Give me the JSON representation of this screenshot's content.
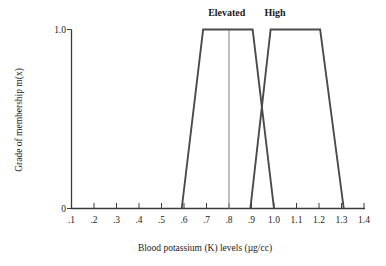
{
  "chart_data": {
    "type": "line",
    "title": "",
    "xlabel": "Blood potassium (K) levels (µg/cc)",
    "ylabel": "Grade of membership m(x)",
    "xlim": [
      0.1,
      1.4
    ],
    "ylim": [
      0,
      1.0
    ],
    "grid": false,
    "legend_position": "above-curves",
    "xticks": [
      ".1",
      ".2",
      ".3",
      ".4",
      ".5",
      ".6",
      ".7",
      ".8",
      ".9",
      "1.0",
      "1.1",
      "1.2",
      "1.3",
      "1.4"
    ],
    "xtick_values": [
      0.1,
      0.2,
      0.3,
      0.4,
      0.5,
      0.6,
      0.7,
      0.8,
      0.9,
      1.0,
      1.1,
      1.2,
      1.3,
      1.4
    ],
    "yticks": [
      "0",
      "1.0"
    ],
    "ytick_values": [
      0,
      1.0
    ],
    "annotations": [
      {
        "text": "Elevated",
        "x": 0.79,
        "y": 1.08
      },
      {
        "text": "High",
        "x": 1.005,
        "y": 1.08
      }
    ],
    "guides": [
      {
        "label": "vertical-guide-0.8",
        "x": 0.8,
        "y0": 0,
        "y1": 1.0
      }
    ],
    "series": [
      {
        "name": "Elevated",
        "shape": "trapezoid",
        "points": [
          {
            "x": 0.59,
            "y": 0
          },
          {
            "x": 0.685,
            "y": 1.0
          },
          {
            "x": 0.905,
            "y": 1.0
          },
          {
            "x": 1.0,
            "y": 0
          }
        ]
      },
      {
        "name": "High",
        "shape": "trapezoid",
        "points": [
          {
            "x": 0.895,
            "y": 0
          },
          {
            "x": 0.985,
            "y": 1.0
          },
          {
            "x": 1.205,
            "y": 1.0
          },
          {
            "x": 1.31,
            "y": 0
          }
        ]
      }
    ]
  },
  "axes": {
    "y_top_label": "1.0",
    "y_bottom_label": "0",
    "x_title": "Blood potassium (K) levels (µg/cc)",
    "y_title": "Grade of membership m(x)"
  },
  "colors": {
    "curve": "#4a4a4a",
    "axis": "#3a3a3a",
    "guide": "#8d8d8d",
    "text": "#1a1a1a",
    "background": "#ffffff"
  }
}
